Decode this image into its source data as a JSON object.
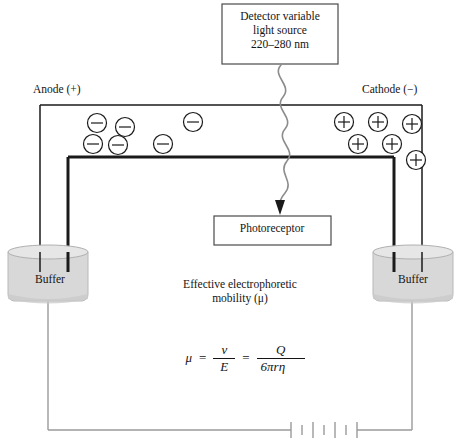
{
  "diagram": {
    "detector": {
      "line1": "Detector variable",
      "line2": "light source",
      "line3": "220–280 nm"
    },
    "photoreceptor": {
      "label": "Photoreceptor"
    },
    "electrodes": {
      "anode": "Anode (+)",
      "cathode": "Cathode (−)"
    },
    "vials": {
      "left": "Buffer",
      "right": "Buffer"
    },
    "caption": {
      "line1": "Effective electrophoretic",
      "line2": "mobility (μ)"
    },
    "formula": {
      "mu": "μ",
      "equals1": "=",
      "numerator1": "v",
      "denominator1": "E",
      "equals2": "=",
      "numerator2": "Q",
      "denominator2": "6πrη",
      "plain": "μ = v/E = Q/6πrη"
    },
    "ions": {
      "negative_symbol": "−",
      "positive_symbol": "+",
      "negative_count": 6,
      "positive_count": 6,
      "negative_positions": [
        {
          "cx": 97,
          "cy": 123
        },
        {
          "cx": 125,
          "cy": 127
        },
        {
          "cx": 193,
          "cy": 122
        },
        {
          "cx": 93,
          "cy": 144
        },
        {
          "cx": 118,
          "cy": 145
        },
        {
          "cx": 163,
          "cy": 144
        }
      ],
      "positive_positions": [
        {
          "cx": 344,
          "cy": 122
        },
        {
          "cx": 378,
          "cy": 122
        },
        {
          "cx": 412,
          "cy": 124
        },
        {
          "cx": 358,
          "cy": 144
        },
        {
          "cx": 392,
          "cy": 144
        },
        {
          "cx": 416,
          "cy": 160
        }
      ]
    },
    "colors": {
      "line": "#1a1a1a",
      "wire": "#9a9a9a",
      "vial_fill": "#d8d8d8",
      "vial_edge": "#b0b0b0",
      "beam": "#8c8c8c",
      "text": "#141414",
      "background": "#ffffff"
    },
    "battery": {
      "symbol": "multi-cell-battery",
      "cells": 3
    }
  }
}
